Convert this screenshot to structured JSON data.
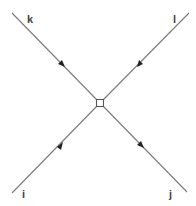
{
  "diagram": {
    "type": "feynman-vertex",
    "vertex": {
      "shape": "square",
      "x": 100,
      "y": 103,
      "size": 7
    },
    "line_color": "#7a7a7a",
    "arrow_color": "#222222",
    "legs": [
      {
        "label": "k",
        "from": [
          12,
          13
        ],
        "to": [
          100,
          103
        ],
        "arrow": "toward-vertex"
      },
      {
        "label": "l",
        "from": [
          189,
          13
        ],
        "to": [
          100,
          103
        ],
        "arrow": "toward-vertex"
      },
      {
        "label": "i",
        "from": [
          12,
          193
        ],
        "to": [
          100,
          103
        ],
        "arrow": "toward-vertex"
      },
      {
        "label": "j",
        "from": [
          187,
          192
        ],
        "to": [
          100,
          103
        ],
        "arrow": "away-from-vertex"
      }
    ]
  }
}
